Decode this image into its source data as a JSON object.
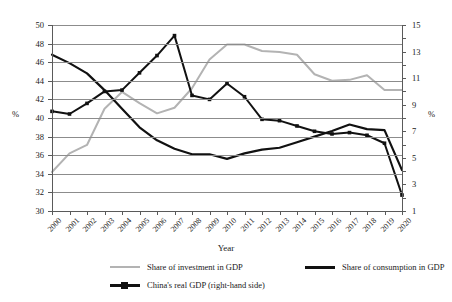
{
  "chart_data": {
    "type": "line",
    "title": "",
    "xlabel": "Year",
    "ylabel": "%",
    "ylabel_right": "%",
    "ylim": [
      30,
      50
    ],
    "ylim_right": [
      1,
      15
    ],
    "yticks": [
      30,
      32,
      34,
      36,
      38,
      40,
      42,
      44,
      46,
      48,
      50
    ],
    "yticks_right": [
      1,
      3,
      5,
      7,
      9,
      11,
      13,
      15
    ],
    "grid": true,
    "legend_position": "bottom",
    "categories": [
      "2000",
      "2001",
      "2002",
      "2003",
      "2004",
      "2005",
      "2006",
      "2007",
      "2008",
      "2009",
      "2010",
      "2011",
      "2012",
      "2013",
      "2014",
      "2015",
      "2016",
      "2017",
      "2018",
      "2019",
      "2020"
    ],
    "series": [
      {
        "name": "Share of investment in GDP",
        "axis": "left",
        "color": "#b3b3b3",
        "marker": "none",
        "values": [
          34.2,
          36.2,
          37.1,
          41.0,
          42.8,
          41.6,
          40.5,
          41.1,
          43.2,
          46.3,
          47.9,
          47.9,
          47.2,
          47.1,
          46.8,
          44.7,
          44.0,
          44.1,
          44.6,
          43.0,
          43.0
        ]
      },
      {
        "name": "Share of consumption in GDP",
        "axis": "left",
        "color": "#111111",
        "marker": "none",
        "values": [
          46.8,
          45.9,
          44.8,
          43.0,
          41.0,
          39.0,
          37.6,
          36.7,
          36.1,
          36.1,
          35.6,
          36.2,
          36.6,
          36.8,
          37.4,
          38.0,
          38.6,
          39.3,
          38.8,
          38.7,
          34.4
        ]
      },
      {
        "name": "China's real GDP (right-hand side)",
        "axis": "right",
        "color": "#111111",
        "marker": "square",
        "values": [
          8.5,
          8.3,
          9.1,
          10.0,
          10.1,
          11.4,
          12.7,
          14.2,
          9.7,
          9.4,
          10.6,
          9.6,
          7.9,
          7.8,
          7.4,
          7.0,
          6.8,
          6.9,
          6.7,
          6.1,
          2.2
        ]
      }
    ]
  },
  "axes": {
    "left_unit": "%",
    "right_unit": "%",
    "x_title": "Year"
  },
  "legend": {
    "items": [
      {
        "label": "Share of investment in GDP",
        "swatch": "line-gray-swatch"
      },
      {
        "label": "Share of consumption in GDP",
        "swatch": "line-black-swatch"
      },
      {
        "label": "China's real GDP (right-hand side)",
        "swatch": "line-black-marker-swatch"
      }
    ]
  }
}
